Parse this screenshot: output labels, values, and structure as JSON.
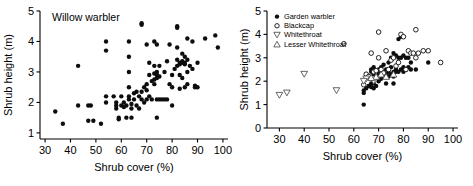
{
  "figure": {
    "panels": [
      "left",
      "right"
    ]
  },
  "chart_data": [
    {
      "type": "scatter",
      "panel": "left",
      "title": "Willow warbler",
      "xlabel": "Shrub cover (%)",
      "ylabel": "Shrub height (m)",
      "xlim": [
        28,
        102
      ],
      "ylim": [
        0.8,
        5.0
      ],
      "xticks": [
        30,
        40,
        50,
        60,
        70,
        80,
        90,
        100
      ],
      "yticks": [
        1,
        2,
        3,
        4,
        5
      ],
      "grid": false,
      "legend": null,
      "series": [
        {
          "name": "Willow warbler",
          "marker": "filled-circle",
          "color": "#0d0d0d",
          "points": [
            [
              34,
              1.7
            ],
            [
              37,
              1.3
            ],
            [
              43,
              3.2
            ],
            [
              43,
              1.9
            ],
            [
              47,
              1.9
            ],
            [
              48,
              1.9
            ],
            [
              47,
              1.4
            ],
            [
              49,
              1.4
            ],
            [
              52,
              1.3
            ],
            [
              54,
              4.0
            ],
            [
              54,
              3.7
            ],
            [
              54,
              2.2
            ],
            [
              54,
              2.0
            ],
            [
              57,
              2.2
            ],
            [
              58,
              1.9
            ],
            [
              58,
              1.8
            ],
            [
              58,
              2.0
            ],
            [
              59,
              1.5
            ],
            [
              59,
              1.45
            ],
            [
              60,
              2.2
            ],
            [
              60,
              1.9
            ],
            [
              61,
              2.0
            ],
            [
              61,
              1.85
            ],
            [
              62,
              1.9
            ],
            [
              62,
              1.5
            ],
            [
              63,
              4.0
            ],
            [
              63,
              3.5
            ],
            [
              63,
              3.0
            ],
            [
              63,
              2.5
            ],
            [
              63,
              2.2
            ],
            [
              63,
              2.1
            ],
            [
              64,
              1.95
            ],
            [
              64,
              1.8
            ],
            [
              64,
              1.5
            ],
            [
              65,
              2.3
            ],
            [
              65,
              2.1
            ],
            [
              66,
              2.35
            ],
            [
              66,
              1.9
            ],
            [
              67,
              2.2
            ],
            [
              67,
              1.8
            ],
            [
              68,
              4.6
            ],
            [
              68,
              4.55
            ],
            [
              68,
              2.35
            ],
            [
              68,
              2.1
            ],
            [
              69,
              2.5
            ],
            [
              69,
              2.0
            ],
            [
              70,
              3.9
            ],
            [
              70,
              2.6
            ],
            [
              70,
              2.4
            ],
            [
              70,
              2.1
            ],
            [
              71,
              3.3
            ],
            [
              71,
              2.9
            ],
            [
              71,
              2.2
            ],
            [
              72,
              2.7
            ],
            [
              72,
              2.1
            ],
            [
              73,
              4.0
            ],
            [
              73,
              3.2
            ],
            [
              73,
              2.95
            ],
            [
              73,
              2.75
            ],
            [
              73,
              2.6
            ],
            [
              74,
              3.9
            ],
            [
              74,
              3.0
            ],
            [
              74,
              2.9
            ],
            [
              74,
              2.8
            ],
            [
              74,
              2.1
            ],
            [
              74,
              1.5
            ],
            [
              75,
              3.2
            ],
            [
              75,
              2.85
            ],
            [
              75,
              2.1
            ],
            [
              76,
              2.1
            ],
            [
              77,
              3.0
            ],
            [
              77,
              2.1
            ],
            [
              78,
              2.1
            ],
            [
              78,
              3.35
            ],
            [
              79,
              3.9
            ],
            [
              79,
              2.6
            ],
            [
              80,
              2.9
            ],
            [
              80,
              2.5
            ],
            [
              80,
              1.9
            ],
            [
              81,
              3.1
            ],
            [
              82,
              4.5
            ],
            [
              82,
              4.45
            ],
            [
              82,
              3.8
            ],
            [
              82,
              3.4
            ],
            [
              82,
              3.2
            ],
            [
              83,
              3.3
            ],
            [
              83,
              3.25
            ],
            [
              83,
              2.9
            ],
            [
              83,
              2.45
            ],
            [
              84,
              3.6
            ],
            [
              84,
              3.35
            ],
            [
              84,
              3.3
            ],
            [
              84,
              2.8
            ],
            [
              85,
              3.5
            ],
            [
              85,
              3.3
            ],
            [
              85,
              3.25
            ],
            [
              85,
              2.5
            ],
            [
              86,
              4.1
            ],
            [
              86,
              3.4
            ],
            [
              86,
              3.0
            ],
            [
              86,
              2.6
            ],
            [
              87,
              3.2
            ],
            [
              88,
              4.0
            ],
            [
              88,
              3.1
            ],
            [
              89,
              2.55
            ],
            [
              89,
              2.5
            ],
            [
              90,
              3.3
            ],
            [
              90,
              2.5
            ],
            [
              93,
              4.1
            ],
            [
              97,
              4.2
            ],
            [
              98,
              3.8
            ]
          ]
        }
      ]
    },
    {
      "type": "scatter",
      "panel": "right",
      "title": "",
      "xlabel": "Shrub cover (%)",
      "ylabel": "Shrub height (m)",
      "xlim": [
        25,
        102
      ],
      "ylim": [
        0,
        5
      ],
      "xticks": [
        30,
        40,
        50,
        60,
        70,
        80,
        90,
        100
      ],
      "yticks": [
        0,
        1,
        2,
        3,
        4,
        5
      ],
      "grid": false,
      "legend": {
        "position": "top-left",
        "entries": [
          {
            "label": "Garden warbler",
            "marker": "filled-circle"
          },
          {
            "label": "Blackcap",
            "marker": "open-circle"
          },
          {
            "label": "Whitethroat",
            "marker": "open-triangle-down"
          },
          {
            "label": "Lesser Whitethroat",
            "marker": "open-triangle-up"
          }
        ]
      },
      "series": [
        {
          "name": "Garden warbler",
          "marker": "filled-circle",
          "color": "#0d0d0d",
          "points": [
            [
              64,
              1.0
            ],
            [
              64,
              1.5
            ],
            [
              64,
              1.6
            ],
            [
              65,
              2.3
            ],
            [
              65,
              1.7
            ],
            [
              66,
              2.2
            ],
            [
              66,
              1.8
            ],
            [
              67,
              2.5
            ],
            [
              67,
              2.4
            ],
            [
              67,
              1.9
            ],
            [
              67,
              1.75
            ],
            [
              68,
              2.6
            ],
            [
              68,
              2.3
            ],
            [
              68,
              1.9
            ],
            [
              68,
              1.7
            ],
            [
              69,
              2.45
            ],
            [
              69,
              2.2
            ],
            [
              69,
              1.8
            ],
            [
              70,
              2.5
            ],
            [
              70,
              2.3
            ],
            [
              70,
              2.0
            ],
            [
              71,
              2.6
            ],
            [
              71,
              2.35
            ],
            [
              71,
              2.1
            ],
            [
              72,
              2.7
            ],
            [
              72,
              2.2
            ],
            [
              73,
              2.5
            ],
            [
              73,
              2.3
            ],
            [
              73,
              1.9
            ],
            [
              74,
              2.8
            ],
            [
              74,
              2.4
            ],
            [
              74,
              2.2
            ],
            [
              75,
              3.0
            ],
            [
              75,
              2.6
            ],
            [
              75,
              2.3
            ],
            [
              76,
              3.2
            ],
            [
              76,
              2.4
            ],
            [
              76,
              2.2
            ],
            [
              76,
              1.9
            ],
            [
              77,
              3.1
            ],
            [
              77,
              2.5
            ],
            [
              77,
              2.4
            ],
            [
              78,
              3.8
            ],
            [
              78,
              3.0
            ],
            [
              78,
              2.4
            ],
            [
              79,
              3.9
            ],
            [
              79,
              3.0
            ],
            [
              79,
              2.5
            ],
            [
              80,
              3.1
            ],
            [
              80,
              2.6
            ],
            [
              80,
              2.4
            ],
            [
              81,
              3.0
            ],
            [
              81,
              2.5
            ],
            [
              82,
              3.0
            ],
            [
              82,
              2.6
            ],
            [
              83,
              2.8
            ],
            [
              83,
              2.5
            ],
            [
              85,
              2.5
            ],
            [
              90,
              2.8
            ]
          ]
        },
        {
          "name": "Blackcap",
          "marker": "open-circle",
          "color": "#0d0d0d",
          "points": [
            [
              56,
              3.6
            ],
            [
              64,
              1.85
            ],
            [
              65,
              2.3
            ],
            [
              66,
              2.2
            ],
            [
              67,
              3.2
            ],
            [
              68,
              2.4
            ],
            [
              69,
              2.45
            ],
            [
              70,
              4.1
            ],
            [
              70,
              3.0
            ],
            [
              71,
              2.5
            ],
            [
              73,
              3.3
            ],
            [
              74,
              2.5
            ],
            [
              75,
              2.9
            ],
            [
              76,
              3.0
            ],
            [
              77,
              2.65
            ],
            [
              78,
              2.8
            ],
            [
              79,
              4.0
            ],
            [
              80,
              3.9
            ],
            [
              82,
              3.3
            ],
            [
              83,
              3.2
            ],
            [
              84,
              3.2
            ],
            [
              85,
              4.2
            ],
            [
              85,
              3.0
            ],
            [
              86,
              3.2
            ],
            [
              88,
              3.3
            ],
            [
              90,
              3.3
            ],
            [
              95,
              2.8
            ],
            [
              72,
              2.35
            ],
            [
              81,
              2.5
            ]
          ]
        },
        {
          "name": "Whitethroat",
          "marker": "open-triangle-down",
          "color": "#4a4a4a",
          "points": [
            [
              30,
              1.4
            ],
            [
              33,
              1.5
            ],
            [
              40,
              2.3
            ],
            [
              53,
              1.6
            ],
            [
              65,
              2.1
            ],
            [
              68,
              2.0
            ],
            [
              64,
              2.0
            ]
          ]
        },
        {
          "name": "Lesser Whitethroat",
          "marker": "open-triangle-up",
          "color": "#4a4a4a",
          "points": [
            [
              69,
              2.2
            ],
            [
              71,
              2.3
            ],
            [
              73,
              2.2
            ],
            [
              76,
              2.3
            ],
            [
              67,
              2.15
            ]
          ]
        }
      ]
    }
  ]
}
